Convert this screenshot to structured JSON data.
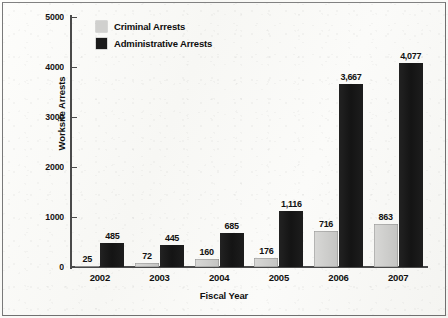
{
  "chart_data": {
    "type": "bar",
    "title": "",
    "xlabel": "Fiscal Year",
    "ylabel": "Worksite Arrests",
    "categories": [
      "2002",
      "2003",
      "2004",
      "2005",
      "2006",
      "2007"
    ],
    "series": [
      {
        "name": "Criminal Arrests",
        "color": "#d0d0ce",
        "values": [
          25,
          72,
          160,
          176,
          716,
          863
        ],
        "labels": [
          "25",
          "72",
          "160",
          "176",
          "716",
          "863"
        ]
      },
      {
        "name": "Administrative Arrests",
        "color": "#1a1a1a",
        "values": [
          485,
          445,
          685,
          1116,
          3667,
          4077
        ],
        "labels": [
          "485",
          "445",
          "685",
          "1,116",
          "3,667",
          "4,077"
        ]
      }
    ],
    "ylim": [
      0,
      5000
    ],
    "yticks": [
      0,
      1000,
      2000,
      3000,
      4000,
      5000
    ],
    "ytick_labels": [
      "0",
      "1000",
      "2000",
      "3000",
      "4000",
      "5000"
    ],
    "grid": false,
    "legend_position": "top-left-inside"
  },
  "axes": {
    "y_title": "Worksite Arrests",
    "x_title": "Fiscal Year"
  },
  "legend": {
    "items": [
      {
        "label": "Criminal Arrests",
        "swatch": "#d0d0ce"
      },
      {
        "label": "Administrative Arrests",
        "swatch": "#1a1a1a"
      }
    ]
  },
  "colors": {
    "criminal": "#d0d0ce",
    "administrative": "#1a1a1a",
    "axis": "#4a4a4a",
    "text": "#101010",
    "page": "#f8f8f5",
    "frame": "#5d5d5d"
  }
}
